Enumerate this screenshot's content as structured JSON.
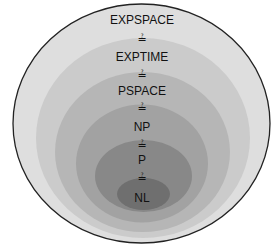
{
  "diagram": {
    "relation_symbol": "≟",
    "classes": [
      {
        "label": "EXPSPACE",
        "fill": "#dedede"
      },
      {
        "label": "EXPTIME",
        "fill": "#cbcbcb"
      },
      {
        "label": "PSPACE",
        "fill": "#b6b6b6"
      },
      {
        "label": "NP",
        "fill": "#a2a2a2"
      },
      {
        "label": "P",
        "fill": "#888888"
      },
      {
        "label": "NL",
        "fill": "#6f6f6f"
      }
    ],
    "relations": [
      "≟",
      "≟",
      "≟",
      "≟",
      "≟"
    ],
    "outline_color": "#222222"
  }
}
